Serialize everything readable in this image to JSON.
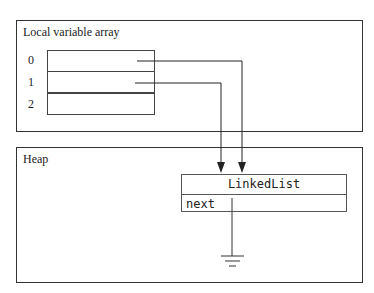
{
  "local_variable_array": {
    "title": "Local variable array",
    "indices": [
      "0",
      "1",
      "2"
    ]
  },
  "heap": {
    "title": "Heap",
    "object": {
      "class_name": "LinkedList",
      "field": "next"
    }
  },
  "references": [
    {
      "from": "slot-0",
      "to": "LinkedList"
    },
    {
      "from": "slot-1",
      "to": "LinkedList"
    },
    {
      "from": "next",
      "to": "null (ground symbol)"
    }
  ]
}
